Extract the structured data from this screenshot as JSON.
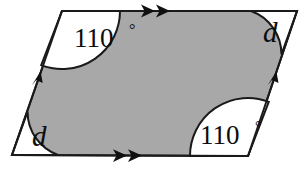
{
  "figure": {
    "kind": "geometry-diagram",
    "shape_name": "parallelogram",
    "background_color": "#ffffff",
    "fill_color": "#a8a8a8",
    "stroke_color": "#1a1a1a",
    "sector_fill_color": "#ffffff",
    "stroke_width": 2,
    "width": 307,
    "height": 172,
    "vertices": {
      "top_left": {
        "x": 62,
        "y": 11
      },
      "top_right": {
        "x": 297,
        "y": 11
      },
      "bottom_right": {
        "x": 248,
        "y": 156
      },
      "bottom_left": {
        "x": 12,
        "y": 155
      }
    },
    "angles": [
      {
        "position": "top-left",
        "label": "110",
        "degree_symbol": "°",
        "label_kind": "measure",
        "arc_radius": 58,
        "label_x": 74,
        "label_y": 47
      },
      {
        "position": "top-right",
        "label": "d",
        "degree_symbol": "",
        "label_kind": "variable",
        "arc_radius": 46,
        "label_x": 263,
        "label_y": 42
      },
      {
        "position": "bottom-left",
        "label": "d",
        "degree_symbol": "",
        "label_kind": "variable",
        "arc_radius": 46,
        "label_x": 32,
        "label_y": 146
      },
      {
        "position": "bottom-right",
        "label": "110",
        "degree_symbol": "°",
        "label_kind": "measure",
        "arc_radius": 58,
        "label_x": 200,
        "label_y": 144
      }
    ],
    "side_marks": [
      {
        "side": "top",
        "tick_count": 2,
        "glyph": "arrowhead",
        "direction": "right"
      },
      {
        "side": "bottom",
        "tick_count": 2,
        "glyph": "arrowhead",
        "direction": "right"
      },
      {
        "side": "left",
        "tick_count": 1,
        "glyph": "arrowhead",
        "direction": "up"
      },
      {
        "side": "right",
        "tick_count": 1,
        "glyph": "arrowhead",
        "direction": "up"
      }
    ]
  }
}
